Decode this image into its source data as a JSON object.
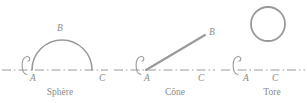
{
  "figure": {
    "background_color": "#ffffff",
    "stroke_color": "#9a9a9a",
    "text_color": "#8a8a8a",
    "axis_style": "dash-dot",
    "panels": [
      {
        "id": "sphere",
        "caption": "Sphère",
        "caption_x": 60,
        "caption_y": 88,
        "shape": "semicircle-arc",
        "axis": {
          "x1": 2,
          "x2": 108,
          "y": 70
        },
        "arc": {
          "cx": 62,
          "cy": 70,
          "r": 30,
          "from_deg": 180,
          "to_deg": 360
        },
        "rotation_arrow": {
          "cx": 27,
          "cy": 65,
          "rx": 5,
          "ry": 9
        },
        "labels": [
          {
            "text": "A",
            "x": 30,
            "y": 74
          },
          {
            "text": "B",
            "x": 57,
            "y": 24
          },
          {
            "text": "C",
            "x": 99,
            "y": 74
          }
        ]
      },
      {
        "id": "cone",
        "caption": "Cône",
        "caption_x": 175,
        "caption_y": 88,
        "shape": "slanted-line",
        "axis": {
          "x1": 114,
          "x2": 215,
          "y": 70
        },
        "generatrix": {
          "x1": 146,
          "y1": 70,
          "x2": 205,
          "y2": 35
        },
        "rotation_arrow": {
          "cx": 141,
          "cy": 65,
          "rx": 5,
          "ry": 9
        },
        "labels": [
          {
            "text": "A",
            "x": 144,
            "y": 74
          },
          {
            "text": "B",
            "x": 209,
            "y": 28
          },
          {
            "text": "C",
            "x": 198,
            "y": 74
          }
        ]
      },
      {
        "id": "tore",
        "caption": "Tore",
        "caption_x": 272,
        "caption_y": 88,
        "shape": "circle",
        "axis": {
          "x1": 221,
          "x2": 305,
          "y": 70
        },
        "circle": {
          "cx": 268,
          "cy": 24,
          "r": 17
        },
        "rotation_arrow": {
          "cx": 238,
          "cy": 65,
          "rx": 5,
          "ry": 9
        },
        "labels": [
          {
            "text": "A",
            "x": 243,
            "y": 74
          },
          {
            "text": "C",
            "x": 272,
            "y": 74
          }
        ]
      }
    ]
  }
}
